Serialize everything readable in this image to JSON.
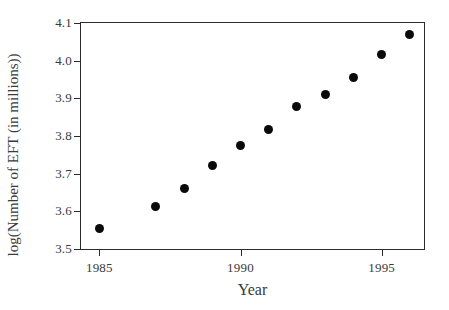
{
  "chart_data": {
    "type": "scatter",
    "title": "",
    "xlabel": "Year",
    "ylabel": "log(Number of EFT (in millions))",
    "xlim": [
      1984.35,
      1996.5
    ],
    "ylim": [
      3.5,
      4.1
    ],
    "xticks": [
      1985,
      1990,
      1995
    ],
    "xtick_labels": [
      "1985",
      "1990",
      "1995"
    ],
    "yticks": [
      3.5,
      3.6,
      3.7,
      3.8,
      3.9,
      4.0,
      4.1
    ],
    "ytick_labels": [
      "3.5",
      "3.6",
      "3.7",
      "3.8",
      "3.9",
      "4.0",
      "4.1"
    ],
    "grid": false,
    "legend": null,
    "marker": "filled-circle",
    "marker_color": "#0a0a0a",
    "x": [
      1985,
      1987,
      1988,
      1989,
      1990,
      1991,
      1992,
      1993,
      1994,
      1995,
      1996
    ],
    "values": [
      3.555,
      3.614,
      3.661,
      3.722,
      3.775,
      3.817,
      3.878,
      3.91,
      3.955,
      4.016,
      4.069
    ],
    "points": [
      {
        "x": 1985,
        "y": 3.555
      },
      {
        "x": 1987,
        "y": 3.614
      },
      {
        "x": 1988,
        "y": 3.661
      },
      {
        "x": 1989,
        "y": 3.722
      },
      {
        "x": 1990,
        "y": 3.775
      },
      {
        "x": 1991,
        "y": 3.817
      },
      {
        "x": 1992,
        "y": 3.878
      },
      {
        "x": 1993,
        "y": 3.91
      },
      {
        "x": 1994,
        "y": 3.955
      },
      {
        "x": 1995,
        "y": 4.016
      },
      {
        "x": 1996,
        "y": 4.069
      }
    ],
    "note_missing_years": [
      1986
    ],
    "frame_color": "#2b2b2b",
    "background_color": "#ffffff"
  }
}
